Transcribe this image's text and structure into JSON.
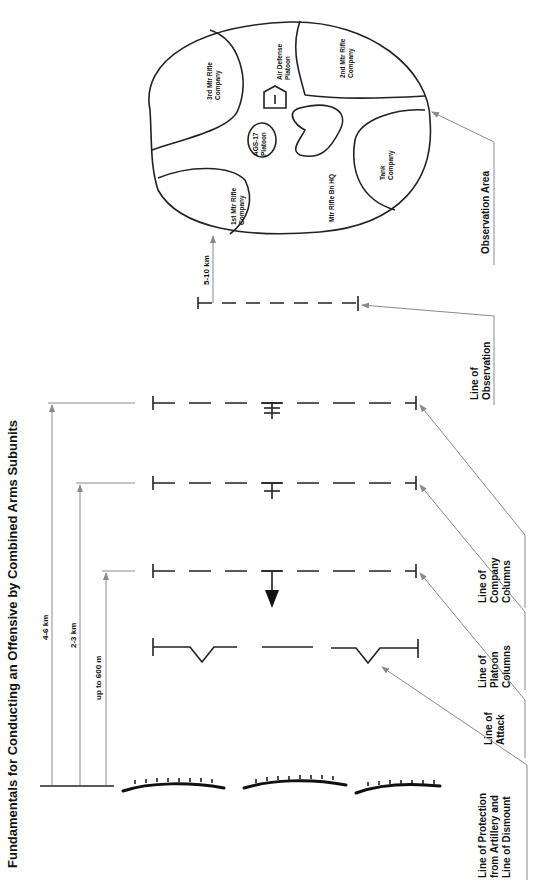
{
  "title": "Fundamentals for Conducting an Offensive by Combined Arms Subunits",
  "distances": {
    "obs_to_area": "5-10 km",
    "company": "4-6 km",
    "platoon": "2-3 km",
    "attack": "up to 600 m"
  },
  "lines": {
    "observation": [
      "Line of",
      "Observation"
    ],
    "company": [
      "Line of",
      "Company",
      "Columns"
    ],
    "platoon": [
      "Line of",
      "Platoon",
      "Columns"
    ],
    "attack": [
      "Line of",
      "Attack"
    ],
    "protection": [
      "Line of Protection",
      "from Artillery and",
      "Line of Dismount"
    ],
    "observation_area": "Observation Area"
  },
  "units": {
    "third_rifle": [
      "3rd Mtr Rifle",
      "Company"
    ],
    "air_defense": [
      "Air Defense",
      "Platoon"
    ],
    "second_rifle": [
      "2nd Mtr Rifle",
      "Company"
    ],
    "ags": [
      "AGS-17",
      "Platoon"
    ],
    "bn_hq": "Mtr Rifle Bn HQ",
    "tank": [
      "Tank",
      "Company"
    ],
    "first_rifle": [
      "1st Mtr Rifle",
      "Company"
    ]
  }
}
